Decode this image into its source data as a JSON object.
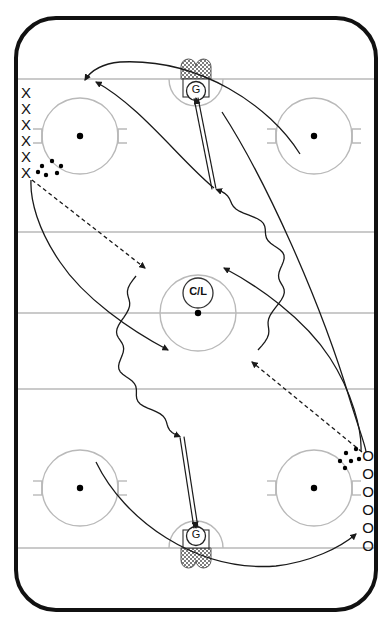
{
  "diagram": {
    "kind": "hockey-rink-drill",
    "title": "",
    "background": "#ffffff",
    "rink": {
      "board_color": "#111111",
      "board_width": 4,
      "corner_radius": 42,
      "x": 14,
      "y": 16,
      "w": 364,
      "h": 596,
      "line_color": "#b9b9b9",
      "line_width": 1.4,
      "goal_lines": [
        79,
        548
      ],
      "blue_lines": [
        232,
        389
      ],
      "center_line": 313
    },
    "faceoff_circles": [
      {
        "id": "top-left",
        "cx": 80,
        "cy": 136,
        "r": 38,
        "dot_r": 3.2,
        "hash": true
      },
      {
        "id": "top-right",
        "cx": 314,
        "cy": 136,
        "r": 38,
        "dot_r": 3.2,
        "hash": true
      },
      {
        "id": "bottom-left",
        "cx": 80,
        "cy": 488,
        "r": 38,
        "dot_r": 3.2,
        "hash": true
      },
      {
        "id": "bottom-right",
        "cx": 314,
        "cy": 488,
        "r": 38,
        "dot_r": 3.2,
        "hash": true
      },
      {
        "id": "center",
        "cx": 198,
        "cy": 313,
        "r": 38,
        "dot_r": 3.2,
        "hash": false
      }
    ],
    "center_marker": {
      "label": "C/L",
      "cx": 198,
      "cy": 293,
      "r": 15
    },
    "goals": [
      {
        "id": "top-goal",
        "label": "G",
        "cx": 196,
        "goal_line_y": 79,
        "orientation": "top",
        "crease_r": 27,
        "net_w": 30,
        "net_h": 20,
        "net_fill": "checker",
        "keeper_circle_r": 9.5,
        "keeper_cy": 91
      },
      {
        "id": "bottom-goal",
        "label": "G",
        "cx": 196,
        "goal_line_y": 548,
        "orientation": "bottom",
        "crease_r": 27,
        "net_w": 30,
        "net_h": 20,
        "net_fill": "checker",
        "keeper_circle_r": 9.5,
        "keeper_cy": 536
      }
    ],
    "player_groups": [
      {
        "id": "x-line",
        "symbol": "X",
        "count": 6,
        "label": "X",
        "x": 26,
        "ys": [
          94,
          110,
          126,
          142,
          158,
          174
        ],
        "font_size": 15
      },
      {
        "id": "o-line",
        "symbol": "O",
        "count": 6,
        "label": "O",
        "x": 368,
        "ys": [
          457,
          475,
          493,
          511,
          529,
          547
        ],
        "font_size": 15
      }
    ],
    "puck_clusters": [
      {
        "id": "x-pucks",
        "r": 2.2,
        "dots": [
          {
            "x": 42,
            "y": 166
          },
          {
            "x": 52,
            "y": 161
          },
          {
            "x": 61,
            "y": 166
          },
          {
            "x": 46,
            "y": 175
          },
          {
            "x": 57,
            "y": 173
          },
          {
            "x": 38,
            "y": 172
          }
        ]
      },
      {
        "id": "o-pucks",
        "r": 2.2,
        "dots": [
          {
            "x": 346,
            "y": 453
          },
          {
            "x": 356,
            "y": 449
          },
          {
            "x": 351,
            "y": 461
          },
          {
            "x": 340,
            "y": 461
          },
          {
            "x": 359,
            "y": 459
          },
          {
            "x": 345,
            "y": 468
          }
        ]
      }
    ],
    "paths": [
      {
        "id": "x-skate-loop-top",
        "kind": "skate",
        "style": "solid",
        "arrow": "end",
        "d": "M 31 180 C 30 200, 38 230, 60 262 C 84 298, 130 330, 168 350",
        "note": "X player skates down-right from corner toward center zone"
      },
      {
        "id": "x-pass-dashed",
        "kind": "pass",
        "style": "dashed",
        "arrow": "end",
        "d": "M 32 180 L 145 268",
        "note": "dashed pass from X line to receiving point"
      },
      {
        "id": "curve-from-top-left-to-shot",
        "kind": "skate",
        "style": "solid",
        "arrow": "end",
        "d": "M 214 188 C 180 160, 140 106, 96 82",
        "note": "long skate arc ending at top-left X line (arrowhead at X line)"
      },
      {
        "id": "top-entry-arc",
        "kind": "skate",
        "style": "solid",
        "arrow": "end",
        "d": "M 300 154 C 270 106, 200 58, 120 62 C 100 64, 90 72, 85 80",
        "note": "arc sweeping from right side up over the top to the X line"
      },
      {
        "id": "carry-wavy-top",
        "kind": "puck-carry",
        "style": "wavy",
        "arrow": "end",
        "note": "wavy puck carry from center-right up to shot position",
        "from": {
          "x": 258,
          "y": 350
        },
        "to": {
          "x": 214,
          "y": 190
        }
      },
      {
        "id": "carry-wavy-bottom",
        "kind": "puck-carry",
        "style": "wavy",
        "arrow": "end",
        "note": "wavy puck carry from center-left down to shot position",
        "from": {
          "x": 136,
          "y": 276
        },
        "to": {
          "x": 182,
          "y": 436
        }
      },
      {
        "id": "shot-top",
        "kind": "shot",
        "style": "double-line",
        "arrow": "end",
        "from": {
          "x": 214,
          "y": 189
        },
        "to": {
          "x": 196,
          "y": 98
        },
        "note": "shot on the top goal"
      },
      {
        "id": "shot-bottom",
        "kind": "shot",
        "style": "double-line",
        "arrow": "end",
        "from": {
          "x": 182,
          "y": 437
        },
        "to": {
          "x": 196,
          "y": 528
        },
        "note": "shot on the bottom goal"
      },
      {
        "id": "o-pass-dashed",
        "kind": "pass",
        "style": "dashed",
        "arrow": "end",
        "d": "M 362 452 L 252 362",
        "note": "dashed pass from O line up-left"
      },
      {
        "id": "o-skate-curve",
        "kind": "skate",
        "style": "solid",
        "arrow": "end",
        "d": "M 361 451 C 362 430, 352 392, 330 358 C 304 318, 258 286, 224 268",
        "note": "O player skates from corner toward center"
      },
      {
        "id": "bottom-entry-arc",
        "kind": "skate",
        "style": "solid",
        "arrow": "end",
        "d": "M 96 462 C 124 520, 196 572, 276 566 C 310 562, 340 548, 356 534",
        "note": "arc sweeping from the bottom-left around to the O line"
      },
      {
        "id": "long-right-curve",
        "kind": "skate",
        "style": "solid",
        "arrow": "none",
        "d": "M 222 112 C 266 180, 320 300, 350 400 C 362 438, 366 448, 366 452",
        "note": "long right-side sweeping curve"
      }
    ],
    "legend_symbols": {
      "x_player": "X",
      "o_player": "O",
      "goalie": "G",
      "center_line_marker": "C/L",
      "puck": "•"
    },
    "colors": {
      "boards": "#111111",
      "ice_lines": "#b9b9b9",
      "path_stroke": "#1a1a1a",
      "net_fill": "#8f8f8f",
      "puck": "#000000"
    }
  }
}
